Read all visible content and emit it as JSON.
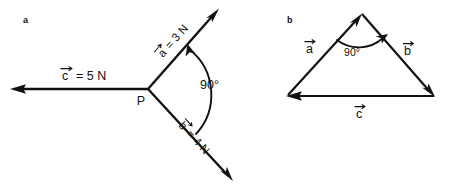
{
  "figure": {
    "background_color": "#ffffff",
    "ink_color": "#111111",
    "width": 452,
    "height": 189
  },
  "panels": [
    {
      "id": "panel-a",
      "letter": "a",
      "description": "Three concurrent force vectors meeting at point P",
      "origin_label": "P",
      "angle_label": "90°",
      "vectors": [
        {
          "name": "c",
          "symbol": "c⃗",
          "label": "c⃗ = 5 N",
          "magnitude": 5,
          "unit": "N",
          "direction": "left",
          "angle_deg": 180,
          "arrow_at": "tip"
        },
        {
          "name": "a",
          "symbol": "a⃗",
          "label": "a⃗ = 3 N",
          "magnitude": 3,
          "unit": "N",
          "direction": "upper-right",
          "angle_deg": 37,
          "arrow_at": "tip"
        },
        {
          "name": "b",
          "symbol": "b⃗",
          "label": "b⃗ = 4 N",
          "magnitude": 4,
          "unit": "N",
          "direction": "lower-right",
          "angle_deg": -53,
          "arrow_at": "tip"
        }
      ]
    },
    {
      "id": "panel-b",
      "letter": "b",
      "description": "Closed vector triangle of the same three vectors",
      "angle_label": "90°",
      "vectors": [
        {
          "name": "a",
          "symbol": "a⃗",
          "label": "a⃗",
          "side": "left",
          "arrow_at": "tip"
        },
        {
          "name": "b",
          "symbol": "b⃗",
          "label": "b⃗",
          "side": "right",
          "arrow_at": "tip"
        },
        {
          "name": "c",
          "symbol": "c⃗",
          "label": "c⃗",
          "side": "base",
          "arrow_at": "tip"
        }
      ]
    }
  ],
  "labels": {
    "panel_a_letter": "a",
    "panel_b_letter": "b",
    "a_vector_label_a": "a⃗ = 3 N",
    "a_vector_label_b": "b⃗ = 4 N",
    "a_vector_label_c": "c⃗ = 5 N",
    "a_point_p": "P",
    "a_angle": "90°",
    "b_vector_label_a": "a⃗",
    "b_vector_label_b": "b⃗",
    "b_vector_label_c": "c⃗",
    "b_angle": "90°"
  },
  "text_pieces": {
    "a_eq_3n": "= 3 N",
    "b_eq_4n": "= 4 N",
    "c_eq_5n": "= 5 N",
    "letter_a": "a",
    "letter_b": "b",
    "letter_c": "c"
  }
}
